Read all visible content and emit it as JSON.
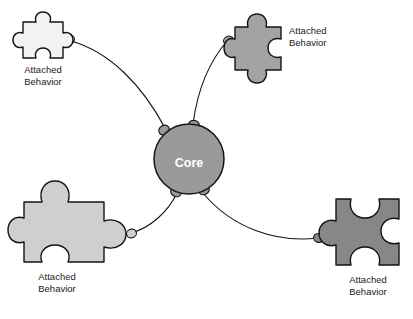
{
  "diagram": {
    "type": "hub-and-spoke-puzzle-diagram",
    "background_color": "#ffffff",
    "outline_color": "#141414",
    "core": {
      "label": "Core",
      "shape": "circle",
      "fill_color": "#9a9a9a",
      "text_color": "#ffffff",
      "center": {
        "x": 189,
        "y": 159
      },
      "radius": 35
    },
    "nodes": [
      {
        "id": "attached-behavior-top-left",
        "label_line1": "Attached",
        "label_line2": "Behavior",
        "fill_color": "#f2f2f2",
        "position": "top-left",
        "label_position": "below",
        "size": "small"
      },
      {
        "id": "attached-behavior-top-right",
        "label_line1": "Attached",
        "label_line2": "Behavior",
        "fill_color": "#a3a3a3",
        "position": "top-right",
        "label_position": "right",
        "size": "medium"
      },
      {
        "id": "attached-behavior-bottom-left",
        "label_line1": "Attached",
        "label_line2": "Behavior",
        "fill_color": "#cfcfcf",
        "position": "bottom-left",
        "label_position": "below",
        "size": "large"
      },
      {
        "id": "attached-behavior-bottom-right",
        "label_line1": "Attached",
        "label_line2": "Behavior",
        "fill_color": "#878787",
        "position": "bottom-right",
        "label_position": "below",
        "size": "large"
      }
    ],
    "connectors": [
      {
        "id": "connector-core-to-top-left",
        "from": "core",
        "to": "attached-behavior-top-left"
      },
      {
        "id": "connector-core-to-top-right",
        "from": "core",
        "to": "attached-behavior-top-right"
      },
      {
        "id": "connector-core-to-bottom-left",
        "from": "core",
        "to": "attached-behavior-bottom-left"
      },
      {
        "id": "connector-core-to-bottom-right",
        "from": "core",
        "to": "attached-behavior-bottom-right"
      }
    ]
  }
}
